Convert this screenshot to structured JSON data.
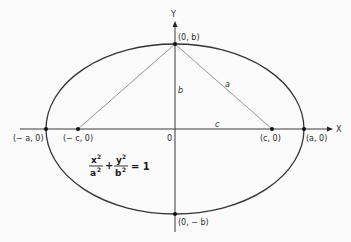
{
  "diagram": {
    "type": "ellipse-geometry",
    "axes": {
      "x_label": "X",
      "y_label": "Y",
      "origin_label": "0"
    },
    "points": {
      "left_vertex": "(− a, 0)",
      "left_focus": "(− c, 0)",
      "right_focus": "(c, 0)",
      "right_vertex": "(a, 0)",
      "top_vertex": "(0, b)",
      "bottom_vertex": "(0, − b)"
    },
    "segment_labels": {
      "semi_minor": "b",
      "hypotenuse": "a",
      "focal_distance": "c"
    },
    "equation": {
      "x_num": "x",
      "x_den": "a",
      "y_num": "y",
      "y_den": "b",
      "exp": "2",
      "plus": "+",
      "equals": "= 1"
    },
    "colors": {
      "background": "#fbfbfb",
      "curve": "#333333",
      "axis": "#3a3a3a",
      "construction_lines": "#8a8a8a",
      "points": "#111111"
    }
  }
}
